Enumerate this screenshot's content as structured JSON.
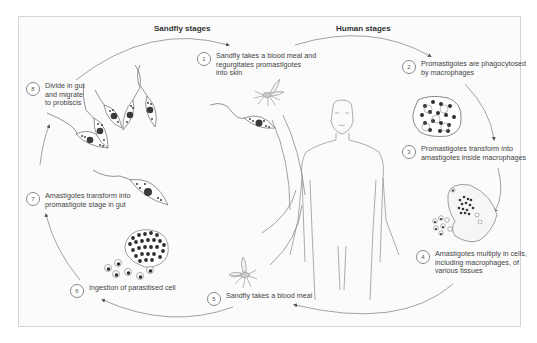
{
  "diagram": {
    "type": "life-cycle",
    "headings": {
      "sandfly": "Sandfly stages",
      "human": "Human stages"
    },
    "steps": [
      {
        "number": "1",
        "text": "Sandfly takes a blood meal and\nregurgitates promastigotes\ninto skin"
      },
      {
        "number": "2",
        "text": "Promastigotes are phagocytosed\nby macrophages"
      },
      {
        "number": "3",
        "text": "Promastigotes transform into\namastigotes inside macrophages"
      },
      {
        "number": "4",
        "text": "Amastigotes multiply in cells,\nincluding macrophages, of\nvarious tissues"
      },
      {
        "number": "5",
        "text": "Sandfly takes a blood meal"
      },
      {
        "number": "6",
        "text": "Ingestion of parasitised cell"
      },
      {
        "number": "7",
        "text": "Amastigotes transform into\npromastigote stage in gut"
      },
      {
        "number": "8",
        "text": "Divide in gut\nand migrate\nto probiscis"
      }
    ],
    "illustrations": [
      "human-figure",
      "sandfly-biting",
      "sandfly-feeding",
      "promastigote",
      "promastigote-cluster",
      "macrophage-with-promastigotes",
      "macrophage-bursting-amastigotes",
      "parasitised-cell-with-amastigotes"
    ],
    "colors": {
      "line": "#777777",
      "nucleus": "#3a3a3a",
      "frame_border": "#d4d4d4",
      "background": "#fbfbfb"
    }
  }
}
